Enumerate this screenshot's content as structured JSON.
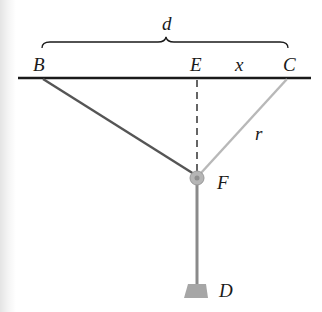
{
  "diagram": {
    "labels": {
      "d": "d",
      "B": "B",
      "E": "E",
      "x": "x",
      "C": "C",
      "r": "r",
      "F": "F",
      "D": "D"
    },
    "colors": {
      "ceiling": "#1a1a1a",
      "rope_BF": "#555555",
      "rope_CF": "#b8b8b8",
      "dashed": "#333333",
      "pulley": "#a8a8a8",
      "rod": "#8a8a8a",
      "weight": "#a6a6a6",
      "text": "#1a1a1a"
    }
  }
}
